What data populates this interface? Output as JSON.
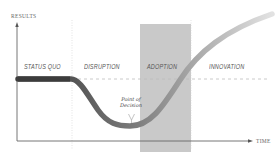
{
  "diagram": {
    "axes": {
      "y_label": "RESULTS",
      "x_label": "TIME"
    },
    "phases": [
      {
        "label": "STATUS QUO"
      },
      {
        "label": "DISRUPTION"
      },
      {
        "label": "ADOPTION"
      },
      {
        "label": "INNOVATION"
      }
    ],
    "annotation": {
      "line1": "Point of",
      "line2": "Decision"
    },
    "colors": {
      "adoption_band": "#c8c8c8",
      "curve_dark": "#4a4a4a",
      "curve_mid": "#8a8a8a",
      "curve_light": "#d8d8d8",
      "axis": "#555555",
      "dashed": "#bbbbbb"
    }
  }
}
